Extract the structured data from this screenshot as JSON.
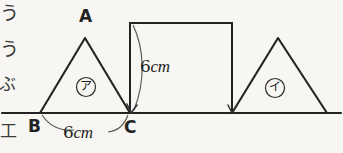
{
  "page": {
    "background_color": "#f7f6f2",
    "ink_color": "#232323",
    "width": 343,
    "height": 153
  },
  "margin_text": {
    "description": "partially cropped Japanese characters at the left edge of the scanned page",
    "lines": [
      "う",
      "う",
      "ぶ",
      "工"
    ]
  },
  "figure": {
    "baseline": {
      "name": "ground-line",
      "y": 113,
      "x_start": 2,
      "x_end": 341
    },
    "shapes": [
      {
        "id": "triangle-abc",
        "type": "triangle",
        "region_tag": "ア",
        "points": "40,113 85,38 130,113",
        "vertices": [
          {
            "label": "A",
            "x": 85,
            "y": 38
          },
          {
            "label": "B",
            "x": 40,
            "y": 113
          },
          {
            "label": "C",
            "x": 130,
            "y": 113
          }
        ]
      },
      {
        "id": "square-cdef",
        "type": "square",
        "x": 130,
        "y": 23,
        "width": 102,
        "height": 90
      },
      {
        "id": "triangle-right",
        "type": "triangle",
        "region_tag": "イ",
        "points": "232,113 278,38 327,113"
      }
    ],
    "dimensions": [
      {
        "id": "base-bc",
        "value": "6",
        "unit": "cm",
        "measures": "side BC of triangle ア",
        "x": 63,
        "y": 126
      },
      {
        "id": "square-side",
        "value": "6",
        "unit": "cm",
        "measures": "left side of the square",
        "x": 137,
        "y": 60
      }
    ],
    "labels": {
      "A": "A",
      "B": "B",
      "C": "C",
      "region_a": "ア",
      "region_i": "イ"
    }
  }
}
